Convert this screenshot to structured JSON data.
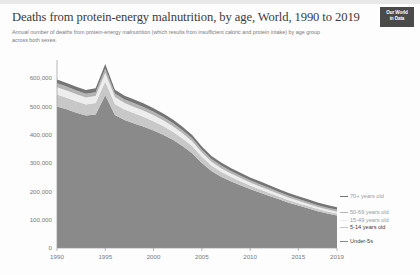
{
  "header": {
    "title": "Deaths from protein-energy malnutrition, by age, World, 1990 to 2019",
    "subtitle": "Annual number of deaths from protein-energy malnutrition (which results from insufficient caloric and protein intake) by age group across both sexes.",
    "logo_line1": "Our World",
    "logo_line2": "in Data"
  },
  "chart_data": {
    "type": "area",
    "stacked": true,
    "title": "Deaths from protein-energy malnutrition, by age, World, 1990 to 2019",
    "xlabel": "",
    "ylabel": "",
    "grid": false,
    "legend_position": "right",
    "xlim": [
      1990,
      2019
    ],
    "ylim": [
      0,
      650000
    ],
    "xticks": [
      1990,
      1995,
      2000,
      2005,
      2010,
      2015,
      2019
    ],
    "xtick_labels": [
      "1990",
      "1995",
      "2000",
      "2005",
      "2010",
      "2015",
      "2019"
    ],
    "yticks": [
      0,
      100000,
      200000,
      300000,
      400000,
      500000,
      600000
    ],
    "ytick_labels": [
      "0",
      "100,000",
      "200,000",
      "300,000",
      "400,000",
      "500,000",
      "600,000"
    ],
    "x": [
      1990,
      1991,
      1992,
      1993,
      1994,
      1995,
      1996,
      1997,
      1998,
      1999,
      2000,
      2001,
      2002,
      2003,
      2004,
      2005,
      2006,
      2007,
      2008,
      2009,
      2010,
      2011,
      2012,
      2013,
      2014,
      2015,
      2016,
      2017,
      2018,
      2019
    ],
    "series": [
      {
        "name": "Under-5s",
        "color": "#8a8a8a",
        "values": [
          500000,
          490000,
          478000,
          468000,
          472000,
          540000,
          470000,
          452000,
          440000,
          428000,
          415000,
          400000,
          382000,
          360000,
          335000,
          300000,
          272000,
          252000,
          236000,
          222000,
          208000,
          196000,
          184000,
          172000,
          160000,
          150000,
          140000,
          130000,
          122000,
          115000
        ]
      },
      {
        "name": "5-14 years old",
        "color": "#c8c8c8",
        "values": [
          42000,
          41000,
          40000,
          39000,
          40000,
          48000,
          39000,
          37000,
          36000,
          35000,
          33000,
          31000,
          29000,
          27000,
          25000,
          22000,
          19000,
          17000,
          15500,
          14000,
          12500,
          11500,
          10500,
          9500,
          9000,
          8500,
          8000,
          7500,
          7000,
          6500
        ]
      },
      {
        "name": "15-49 years old",
        "color": "#ededed",
        "values": [
          26000,
          25500,
          25000,
          24500,
          25000,
          30000,
          24000,
          23000,
          22500,
          22000,
          21000,
          20000,
          19000,
          18000,
          17000,
          15500,
          14000,
          13000,
          12000,
          11000,
          10500,
          10000,
          9500,
          9000,
          8500,
          8000,
          7500,
          7200,
          7000,
          6800
        ]
      },
      {
        "name": "50-69 years old",
        "color": "#b4b4b4",
        "values": [
          14000,
          13800,
          13600,
          13400,
          13600,
          16000,
          13200,
          13000,
          12800,
          12600,
          12200,
          11800,
          11400,
          11000,
          10600,
          10000,
          9400,
          9000,
          8600,
          8300,
          8000,
          7800,
          7600,
          7400,
          7200,
          7000,
          6800,
          6600,
          6500,
          6400
        ]
      },
      {
        "name": "70+ years old",
        "color": "#757575",
        "values": [
          13000,
          13000,
          13000,
          13000,
          13400,
          16000,
          13000,
          13000,
          13000,
          13000,
          12800,
          12600,
          12400,
          12200,
          12000,
          11500,
          11000,
          10800,
          10600,
          10400,
          10200,
          10100,
          10000,
          9900,
          9800,
          9700,
          9600,
          9500,
          9400,
          9300
        ]
      }
    ]
  },
  "legend": {
    "items": [
      {
        "label": "70+ years old",
        "color": "#757575"
      },
      {
        "label": "50-69 years old",
        "color": "#b4b4b4"
      },
      {
        "label": "15-49 years old",
        "color": "#ededed"
      },
      {
        "label": "5-14 years old",
        "color": "#c8c8c8"
      },
      {
        "label": "Under-5s",
        "color": "#8a8a8a"
      }
    ]
  }
}
